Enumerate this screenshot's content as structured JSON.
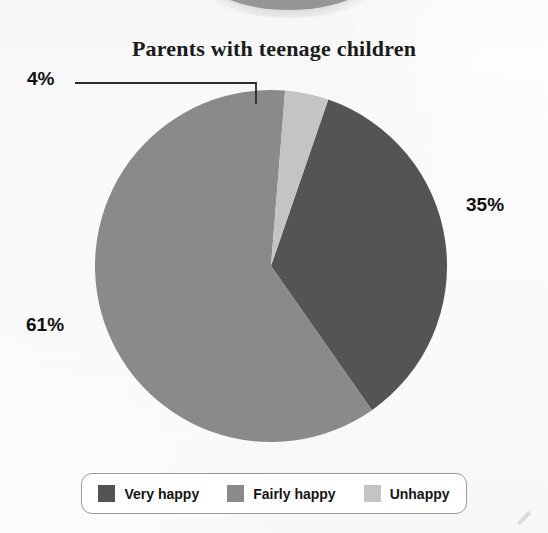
{
  "chart_data": {
    "type": "pie",
    "title": "Parents with teenage children",
    "categories": [
      "Very happy",
      "Fairly happy",
      "Unhappy"
    ],
    "values": [
      35,
      61,
      4
    ],
    "value_labels": [
      "35%",
      "61%",
      "4%"
    ],
    "colors": [
      "#545454",
      "#8a8a8a",
      "#c4c4c4"
    ],
    "units": "percent",
    "start_angle_deg": 19,
    "direction": "clockwise",
    "legend_position": "bottom",
    "grid": false,
    "xlabel": "",
    "ylabel": "",
    "annotations": [
      {
        "text": "4%",
        "points_to": "Unhappy",
        "leader_line": true
      }
    ]
  },
  "title": {
    "text": "Parents with teenage children"
  },
  "labels": {
    "very_happy_pct": "35%",
    "fairly_happy_pct": "61%",
    "unhappy_pct": "4%"
  },
  "legend": {
    "items": [
      {
        "label": "Very happy",
        "color": "#545454"
      },
      {
        "label": "Fairly happy",
        "color": "#8a8a8a"
      },
      {
        "label": "Unhappy",
        "color": "#c4c4c4"
      }
    ]
  },
  "colors": {
    "very_happy": "#545454",
    "fairly_happy": "#8a8a8a",
    "unhappy": "#c4c4c4",
    "leader_line": "#2b2b2b",
    "legend_border": "#9a9a9a",
    "text": "#141414",
    "background": "#ffffff"
  }
}
